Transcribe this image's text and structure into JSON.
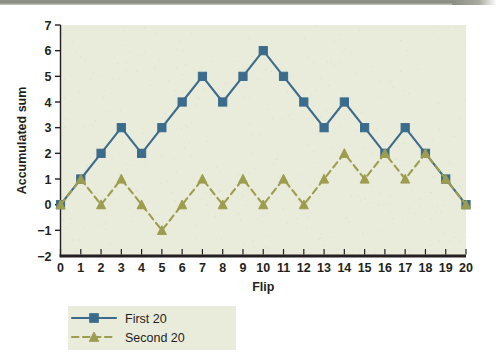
{
  "chart_data": {
    "type": "line",
    "title": "",
    "xlabel": "Flip",
    "ylabel": "Accumulated sum",
    "x": [
      0,
      1,
      2,
      3,
      4,
      5,
      6,
      7,
      8,
      9,
      10,
      11,
      12,
      13,
      14,
      15,
      16,
      17,
      18,
      19,
      20
    ],
    "xlim": [
      0,
      20
    ],
    "ylim": [
      -2,
      7
    ],
    "xticks": [
      "0",
      "1",
      "2",
      "3",
      "4",
      "5",
      "6",
      "7",
      "8",
      "9",
      "10",
      "11",
      "12",
      "13",
      "14",
      "15",
      "16",
      "17",
      "18",
      "19",
      "20"
    ],
    "yticks": [
      "7",
      "6",
      "5",
      "4",
      "3",
      "2",
      "1",
      "0",
      "−1",
      "−2"
    ],
    "ytick_values": [
      7,
      6,
      5,
      4,
      3,
      2,
      1,
      0,
      -1,
      -2
    ],
    "grid": false,
    "legend_position": "bottom-left",
    "series": [
      {
        "name": "First 20",
        "values": [
          0,
          1,
          2,
          3,
          2,
          3,
          4,
          5,
          4,
          5,
          6,
          5,
          4,
          3,
          4,
          3,
          2,
          3,
          2,
          1,
          0
        ],
        "color": "#3b6c8c",
        "marker": "square",
        "linestyle": "solid"
      },
      {
        "name": "Second 20",
        "values": [
          0,
          1,
          0,
          1,
          0,
          -1,
          0,
          1,
          0,
          1,
          0,
          1,
          0,
          1,
          2,
          1,
          2,
          1,
          2,
          1,
          0
        ],
        "color": "#9c9d4e",
        "marker": "triangle",
        "linestyle": "dashed"
      }
    ]
  },
  "plot": {
    "background_color": "#e9ebdb",
    "axis_color": "#231f20",
    "page_background": "#ffffff"
  },
  "legend": {
    "entries": [
      {
        "label": "First 20"
      },
      {
        "label": "Second 20"
      }
    ]
  }
}
